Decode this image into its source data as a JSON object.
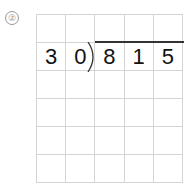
{
  "problem": {
    "number_label": "②",
    "divisor": [
      "3",
      "0"
    ],
    "dividend": [
      "8",
      "1",
      "5"
    ],
    "rows": [
      [
        "",
        "",
        "",
        "",
        ""
      ],
      [
        "3",
        "0",
        "8",
        "1",
        "5"
      ],
      [
        "",
        "",
        "",
        "",
        ""
      ],
      [
        "",
        "",
        "",
        "",
        ""
      ],
      [
        "",
        "",
        "",
        "",
        ""
      ],
      [
        "",
        "",
        "",
        "",
        ""
      ]
    ]
  }
}
